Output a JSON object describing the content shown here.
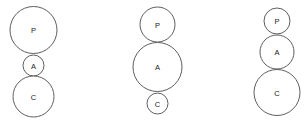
{
  "diagram": {
    "type": "tangent-circle-stacks",
    "background_color": "#ffffff",
    "stroke_color": "#5e5e5e",
    "label_color": "#1a1a1a",
    "width": 304,
    "height": 129,
    "groups": [
      {
        "id": "group-1",
        "center_x": 33.5,
        "nodes": [
          {
            "label": "P",
            "cx": 33.5,
            "cy": 30.0,
            "r": 23.5
          },
          {
            "label": "A",
            "cx": 33.5,
            "cy": 65.5,
            "r": 10.5
          },
          {
            "label": "C",
            "cx": 33.5,
            "cy": 96.5,
            "r": 20.5
          }
        ]
      },
      {
        "id": "group-2",
        "center_x": 157.5,
        "nodes": [
          {
            "label": "P",
            "cx": 157.5,
            "cy": 24.5,
            "r": 17.5
          },
          {
            "label": "A",
            "cx": 157.5,
            "cy": 67.0,
            "r": 24.5
          },
          {
            "label": "C",
            "cx": 157.5,
            "cy": 103.5,
            "r": 10.5
          }
        ]
      },
      {
        "id": "group-3",
        "center_x": 277.0,
        "nodes": [
          {
            "label": "P",
            "cx": 277.0,
            "cy": 21.0,
            "r": 13.0
          },
          {
            "label": "A",
            "cx": 277.0,
            "cy": 52.0,
            "r": 17.0
          },
          {
            "label": "C",
            "cx": 277.0,
            "cy": 92.5,
            "r": 23.0
          }
        ]
      }
    ]
  }
}
